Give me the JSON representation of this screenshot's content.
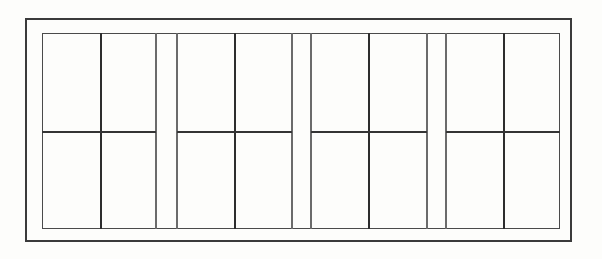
{
  "page": {
    "width": 602,
    "height": 259,
    "background": "#fdfdfb"
  },
  "diagram": {
    "kind": "line-drawing",
    "colors": {
      "background": "#fdfdfb",
      "outer_frame": "#3b3b3b",
      "inner_frame": "#4a4a4a",
      "heavy_line": "#2d2d2d",
      "light_line": "#6b6b6b",
      "rail": "#343434"
    },
    "outer_frame": {
      "x": 25,
      "y": 18,
      "width": 547,
      "height": 224,
      "stroke": 2
    },
    "inner_frame": {
      "x": 42,
      "y": 33,
      "width": 518,
      "height": 196,
      "stroke": 1.4
    },
    "vertical_lines": [
      {
        "x": 101,
        "weight": "heavy"
      },
      {
        "x": 156,
        "weight": "light"
      },
      {
        "x": 177,
        "weight": "light"
      },
      {
        "x": 235,
        "weight": "heavy"
      },
      {
        "x": 292,
        "weight": "light"
      },
      {
        "x": 311,
        "weight": "light"
      },
      {
        "x": 369,
        "weight": "heavy"
      },
      {
        "x": 427,
        "weight": "light"
      },
      {
        "x": 446,
        "weight": "light"
      },
      {
        "x": 504,
        "weight": "heavy"
      }
    ],
    "line_weights_px": {
      "heavy": 2.2,
      "light": 1.2
    },
    "mid_rail": {
      "y": 132,
      "stroke": 2,
      "segments": [
        [
          42,
          156
        ],
        [
          177,
          292
        ],
        [
          311,
          427
        ],
        [
          446,
          560
        ]
      ]
    }
  }
}
